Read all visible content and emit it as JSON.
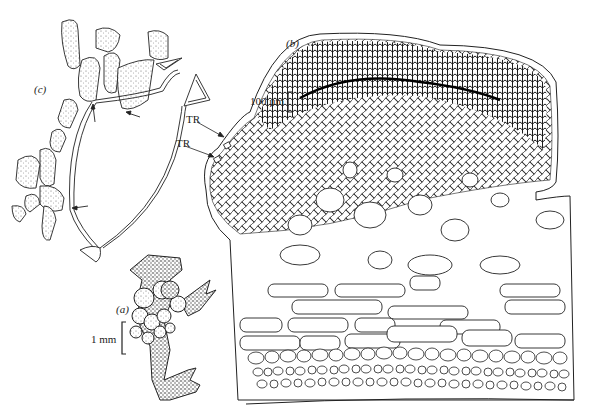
{
  "figure": {
    "panels": [
      {
        "id": "a",
        "label": "(a)",
        "description": "habit sketch of host thallus with clustered galls",
        "scale_label": "1 mm"
      },
      {
        "id": "b",
        "label": "(b)",
        "description": "section through gall showing dense filament network over host cells",
        "scale_label": "100 µm"
      },
      {
        "id": "c",
        "label": "(c)",
        "description": "filament connections between stippled host cells with arrows"
      }
    ],
    "annotations": [
      {
        "text": "TR",
        "target": "upper trichome"
      },
      {
        "text": "TR",
        "target": "lower trichome"
      }
    ],
    "colors": {
      "ink": "#1a1a1a",
      "stipple": "#555555",
      "paper": "#ffffff"
    }
  }
}
